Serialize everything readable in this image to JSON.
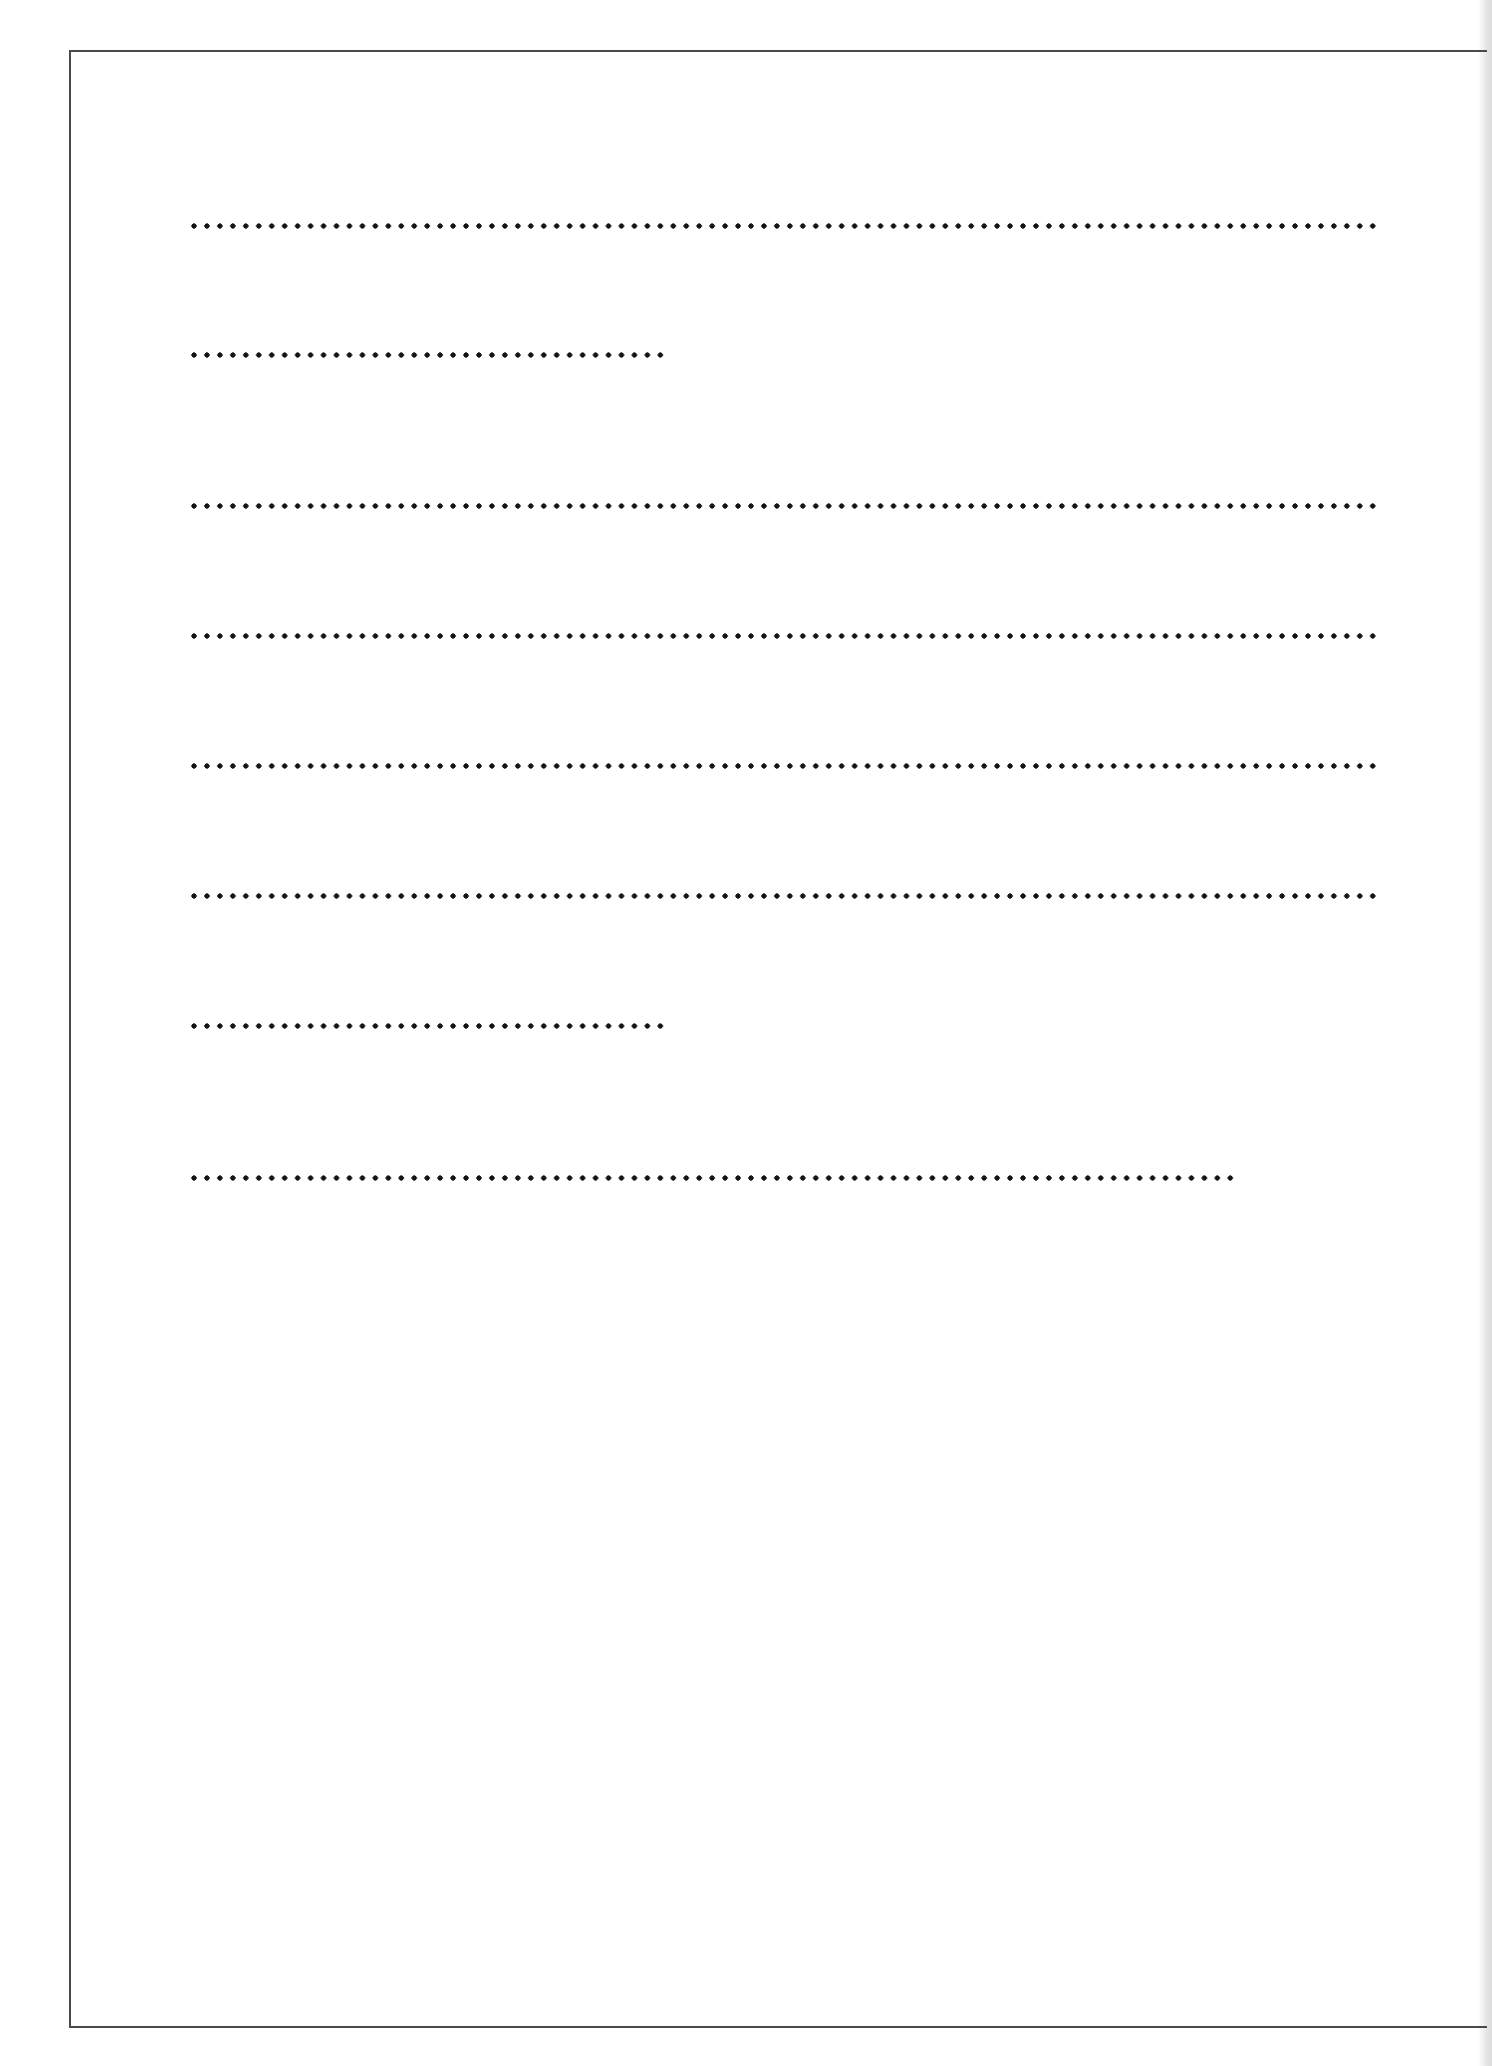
{
  "page": {
    "type": "blank-lined-form",
    "frame_color": "#4a4a4a",
    "dot_color": "#141414",
    "background": "#ffffff"
  },
  "dotted_lines": [
    {
      "id": 1,
      "y": 226,
      "x_start": 194,
      "x_end": 1379,
      "dot_count": 92,
      "length": "full",
      "content": ""
    },
    {
      "id": 2,
      "y": 355,
      "x_start": 194,
      "x_end": 661,
      "dot_count": 37,
      "length": "short",
      "content": ""
    },
    {
      "id": 3,
      "y": 506,
      "x_start": 194,
      "x_end": 1379,
      "dot_count": 92,
      "length": "full",
      "content": ""
    },
    {
      "id": 4,
      "y": 636,
      "x_start": 194,
      "x_end": 1379,
      "dot_count": 92,
      "length": "full",
      "content": ""
    },
    {
      "id": 5,
      "y": 766,
      "x_start": 194,
      "x_end": 1379,
      "dot_count": 92,
      "length": "full",
      "content": ""
    },
    {
      "id": 6,
      "y": 896,
      "x_start": 194,
      "x_end": 1379,
      "dot_count": 92,
      "length": "full",
      "content": ""
    },
    {
      "id": 7,
      "y": 1026,
      "x_start": 194,
      "x_end": 661,
      "dot_count": 37,
      "length": "short",
      "content": ""
    },
    {
      "id": 8,
      "y": 1178,
      "x_start": 194,
      "x_end": 1236,
      "dot_count": 81,
      "length": "medium",
      "content": ""
    }
  ]
}
